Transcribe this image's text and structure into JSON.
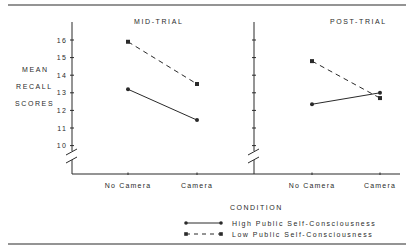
{
  "chart_data": [
    {
      "type": "line",
      "title": "MID-TRIAL",
      "xlabel": "CONDITION",
      "ylabel": "MEAN RECALL SCORES",
      "categories": [
        "No Camera",
        "Camera"
      ],
      "ylim": [
        10,
        16.5
      ],
      "yticks": [
        10,
        11,
        12,
        13,
        14,
        15,
        16
      ],
      "axis_break": true,
      "series": [
        {
          "name": "High Public Self-Consciousness",
          "style": "solid",
          "marker": "circle",
          "values": [
            13.2,
            11.45
          ]
        },
        {
          "name": "Low Public Self-Consciousness",
          "style": "dashed",
          "marker": "square",
          "values": [
            15.9,
            13.5
          ]
        }
      ]
    },
    {
      "type": "line",
      "title": "POST-TRIAL",
      "xlabel": "CONDITION",
      "ylabel": "MEAN RECALL SCORES",
      "categories": [
        "No Camera",
        "Camera"
      ],
      "ylim": [
        10,
        16.5
      ],
      "yticks": [
        10,
        11,
        12,
        13,
        14,
        15,
        16
      ],
      "axis_break": true,
      "series": [
        {
          "name": "High Public Self-Consciousness",
          "style": "solid",
          "marker": "circle",
          "values": [
            12.35,
            13.0
          ]
        },
        {
          "name": "Low Public Self-Consciousness",
          "style": "dashed",
          "marker": "square",
          "values": [
            14.8,
            12.7
          ]
        }
      ]
    }
  ],
  "ylabel_lines": [
    "MEAN",
    "RECALL",
    "SCORES"
  ],
  "xlabel": "CONDITION",
  "legend": [
    {
      "label": "High Public Self-Consciousness",
      "style": "solid",
      "marker": "circle"
    },
    {
      "label": "Low Public Self-Consciousness",
      "style": "dashed",
      "marker": "square"
    }
  ],
  "colors": {
    "ink": "#2a2a2a"
  }
}
